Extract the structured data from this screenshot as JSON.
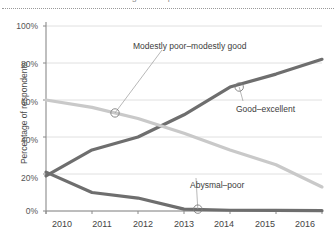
{
  "figure": {
    "cut_title": "Percentage of respondents",
    "divider": "dotted-rule"
  },
  "chart_data": {
    "type": "line",
    "title": "",
    "xlabel": "",
    "ylabel": "Percentage of respondents",
    "x": [
      2010,
      2011,
      2012,
      2013,
      2014,
      2015,
      2016
    ],
    "xticklabels": [
      "2010",
      "2011",
      "2012",
      "2013",
      "2014",
      "2015",
      "2016"
    ],
    "yticklabels": [
      "0%",
      "20%",
      "40%",
      "60%",
      "80%",
      "100%"
    ],
    "yticks": [
      0,
      20,
      40,
      60,
      80,
      100
    ],
    "ylim": [
      0,
      100
    ],
    "xlim": [
      2010,
      2016
    ],
    "grid": "horizontal",
    "legend": "annotations",
    "series": [
      {
        "name": "Good–excellent",
        "color": "#6e6e6e",
        "width": 3.2,
        "values": [
          19,
          33,
          40,
          52,
          67,
          74,
          82
        ]
      },
      {
        "name": "Modestly poor–modestly good",
        "color": "#c9c9c9",
        "width": 3.2,
        "values": [
          60,
          56,
          50,
          42,
          33,
          25,
          13
        ]
      },
      {
        "name": "Abysmal–poor",
        "color": "#6e6e6e",
        "width": 3.2,
        "values": [
          21,
          10,
          7,
          1,
          0.4,
          0.3,
          0.2
        ]
      }
    ],
    "annotations": [
      {
        "label": "Modestly poor–modestly good",
        "series": "Modestly poor–modestly good",
        "marker_x": 2011.5,
        "marker_y": 53
      },
      {
        "label": "Good–excellent",
        "series": "Good–excellent",
        "marker_x": 2014.2,
        "marker_y": 67
      },
      {
        "label": "Abysmal–poor",
        "series": "Abysmal–poor",
        "marker_x": 2013.3,
        "marker_y": 1
      }
    ]
  }
}
